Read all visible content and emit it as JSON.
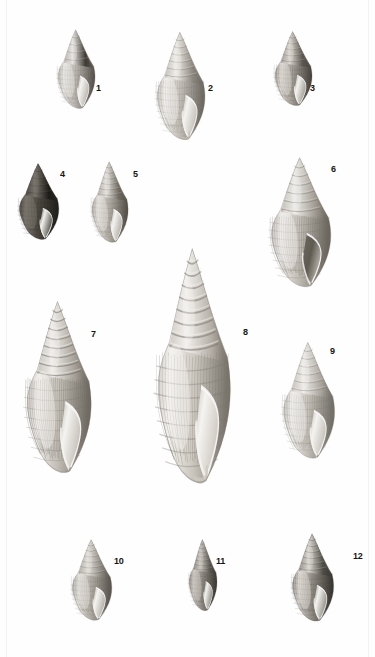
{
  "plate": {
    "type": "scientific-illustration-plate",
    "subject": "gastropod shells",
    "background_color": "#fefefe",
    "border_color": "#f2f2f2",
    "label_color": "#151515",
    "width": 375,
    "height": 657
  },
  "specimens": [
    {
      "number": "1",
      "label_x": 96,
      "label_y": 84,
      "label_size": 9,
      "x": 54,
      "y": 28,
      "w": 45,
      "h": 83,
      "tone": "dark-banded",
      "body_light": "#e8e6e2",
      "body_mid": "#b6b2ab",
      "body_dark": "#5a5650",
      "spire_dark": "#3a3630",
      "whorls": 5,
      "ribs": 14,
      "aperture": "narrow-elongate"
    },
    {
      "number": "2",
      "label_x": 208,
      "label_y": 84,
      "label_size": 9,
      "x": 152,
      "y": 30,
      "w": 58,
      "h": 113,
      "tone": "light-grey",
      "body_light": "#f0eeea",
      "body_mid": "#c2bdb5",
      "body_dark": "#6e6a63",
      "spire_dark": "#8d887f",
      "whorls": 7,
      "ribs": 20,
      "aperture": "wide-with-canal"
    },
    {
      "number": "3",
      "label_x": 310,
      "label_y": 84,
      "label_size": 9,
      "x": 271,
      "y": 30,
      "w": 45,
      "h": 78,
      "tone": "mid-grey-ribbed",
      "body_light": "#ddd9d3",
      "body_mid": "#9d9890",
      "body_dark": "#4b4741",
      "spire_dark": "#5b5750",
      "whorls": 6,
      "ribs": 16,
      "aperture": "oval"
    },
    {
      "number": "4",
      "label_x": 60,
      "label_y": 170,
      "label_size": 9,
      "x": 15,
      "y": 162,
      "w": 48,
      "h": 80,
      "tone": "very-dark",
      "body_light": "#7a756d",
      "body_mid": "#4a463f",
      "body_dark": "#23211d",
      "spire_dark": "#1d1b18",
      "whorls": 5,
      "ribs": 12,
      "aperture": "oval-pale"
    },
    {
      "number": "5",
      "label_x": 133,
      "label_y": 170,
      "label_size": 9,
      "x": 88,
      "y": 160,
      "w": 44,
      "h": 85,
      "tone": "mid-grey-ribbed",
      "body_light": "#e6e3de",
      "body_mid": "#b0aba3",
      "body_dark": "#57534c",
      "spire_dark": "#6d6961",
      "whorls": 7,
      "ribs": 18,
      "aperture": "oval"
    },
    {
      "number": "6",
      "label_x": 331,
      "label_y": 165,
      "label_size": 9,
      "x": 265,
      "y": 155,
      "w": 72,
      "h": 136,
      "tone": "light-grey",
      "body_light": "#efedea",
      "body_mid": "#bfbab2",
      "body_dark": "#6b675f",
      "spire_dark": "#a09a92",
      "whorls": 7,
      "ribs": 26,
      "aperture": "wide-dark"
    },
    {
      "number": "7",
      "label_x": 91,
      "label_y": 330,
      "label_size": 9,
      "x": 20,
      "y": 298,
      "w": 78,
      "h": 180,
      "tone": "light-grey-tall",
      "body_light": "#f1efec",
      "body_mid": "#c4bfb7",
      "body_dark": "#706b63",
      "spire_dark": "#a7a199",
      "whorls": 9,
      "ribs": 30,
      "aperture": "large-pale"
    },
    {
      "number": "8",
      "label_x": 243,
      "label_y": 328,
      "label_size": 9,
      "x": 150,
      "y": 244,
      "w": 88,
      "h": 246,
      "tone": "pale-large",
      "body_light": "#f4f2ef",
      "body_mid": "#cdc8c0",
      "body_dark": "#7a756c",
      "spire_dark": "#b4aea6",
      "whorls": 9,
      "ribs": 24,
      "aperture": "large-elongate-canal"
    },
    {
      "number": "9",
      "label_x": 330,
      "label_y": 347,
      "label_size": 9,
      "x": 278,
      "y": 340,
      "w": 62,
      "h": 122,
      "tone": "light-grey",
      "body_light": "#f0eeeb",
      "body_mid": "#c3beb6",
      "body_dark": "#737069",
      "spire_dark": "#a8a39b",
      "whorls": 7,
      "ribs": 22,
      "aperture": "oval-pale"
    },
    {
      "number": "10",
      "label_x": 114,
      "label_y": 557,
      "label_size": 9,
      "x": 68,
      "y": 538,
      "w": 48,
      "h": 85,
      "tone": "mid-grey",
      "body_light": "#e4e1dc",
      "body_mid": "#aeaaa2",
      "body_dark": "#5c5851",
      "spire_dark": "#8a857d",
      "whorls": 7,
      "ribs": 18,
      "aperture": "oval-pale"
    },
    {
      "number": "11",
      "label_x": 216,
      "label_y": 557,
      "label_size": 9,
      "x": 186,
      "y": 538,
      "w": 34,
      "h": 75,
      "tone": "dark-grey",
      "body_light": "#cecac4",
      "body_mid": "#8b8780",
      "body_dark": "#413e38",
      "spire_dark": "#5a5750",
      "whorls": 8,
      "ribs": 16,
      "aperture": "small-oval"
    },
    {
      "number": "12",
      "label_x": 353,
      "label_y": 552,
      "label_size": 9,
      "x": 288,
      "y": 532,
      "w": 50,
      "h": 92,
      "tone": "dark-reticulate",
      "body_light": "#ddd9d3",
      "body_mid": "#8e8a82",
      "body_dark": "#3c3934",
      "spire_dark": "#4f4c45",
      "whorls": 7,
      "ribs": 20,
      "aperture": "oval-pale"
    }
  ]
}
